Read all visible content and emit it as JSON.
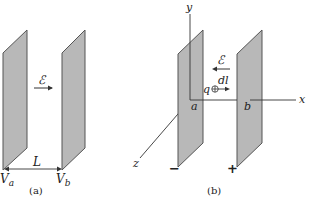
{
  "panels": [
    {
      "id": "a",
      "caption": "(a)",
      "field_label": "ℰ",
      "field_direction": "right",
      "separation_label": "L",
      "left_potential": {
        "main": "V",
        "sub": "a"
      },
      "right_potential": {
        "main": "V",
        "sub": "b"
      }
    },
    {
      "id": "b",
      "caption": "(b)",
      "field_label": "ℰ",
      "field_direction": "left",
      "charge_label": "q",
      "displacement_label": "dl",
      "axes": {
        "x": "x",
        "y": "y",
        "z": "z"
      },
      "left_plate_label": "a",
      "right_plate_label": "b",
      "left_plate_sign": "−",
      "right_plate_sign": "+"
    }
  ],
  "colors": {
    "plate_fill": "#b8b8b8",
    "plate_edge": "#555555",
    "line": "#333333"
  }
}
